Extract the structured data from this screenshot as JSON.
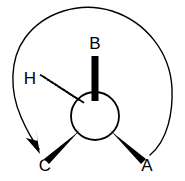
{
  "figure": {
    "kind": "stereochemistry-chiral-center-diagram",
    "background_color": "#ffffff",
    "ink_color": "#000000"
  },
  "center": {
    "label": "",
    "cx": 95,
    "cy": 116,
    "r": 24,
    "stroke_width": 1.6
  },
  "substituents": [
    {
      "id": "B",
      "label": "B",
      "bond_style": "plain-bold",
      "direction": "up",
      "angle_deg": 90,
      "label_x": 95,
      "label_y": 49,
      "bond_x1": 95,
      "bond_y1": 56,
      "bond_x2": 95,
      "bond_y2": 100,
      "bond_width": 7
    },
    {
      "id": "A",
      "label": "A",
      "bond_style": "wedge",
      "direction": "down-right",
      "angle_deg": -45,
      "label_x": 147,
      "label_y": 170,
      "bond_x1": 113,
      "bond_y1": 133,
      "bond_x2": 143,
      "bond_y2": 157,
      "bond_width_wide": 9,
      "bond_width_narrow": 5
    },
    {
      "id": "C",
      "label": "C",
      "bond_style": "wedge",
      "direction": "down-left",
      "angle_deg": 225,
      "label_x": 45,
      "label_y": 170,
      "bond_x1": 78,
      "bond_y1": 133,
      "bond_x2": 48,
      "bond_y2": 157,
      "bond_width_wide": 9,
      "bond_width_narrow": 5
    },
    {
      "id": "H",
      "label": "H",
      "bond_style": "hashed-dash",
      "direction": "up-left",
      "angle_deg": 143,
      "label_x": 30,
      "label_y": 84,
      "bond_x1": 41,
      "bond_y1": 79,
      "bond_x2": 79,
      "bond_y2": 101,
      "hash_count": 12,
      "hash_width_start": 8,
      "hash_width_end": 12,
      "hash_stroke": 1.7
    }
  ],
  "rotation_arrow": {
    "name": "counterclockwise-rotation-arrow",
    "description": "large open arc sweeping from lower-right around the top to lower-left, ending in a filled arrowhead above label C",
    "stroke_width": 1.4,
    "arc_cx": 93,
    "arc_cy": 85,
    "arc_rx": 80,
    "arc_ry": 72,
    "start_x": 150,
    "start_y": 155,
    "end_x": 40,
    "end_y": 148,
    "arrowhead_x": 38,
    "arrowhead_y": 152,
    "arrowhead_angle_deg": 55,
    "arrowhead_length": 15,
    "arrowhead_halfwidth": 5
  }
}
